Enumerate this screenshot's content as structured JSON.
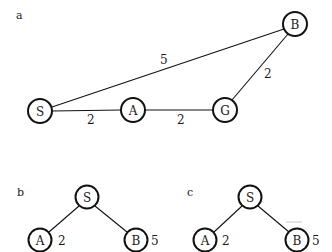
{
  "colors": {
    "stroke": "#111111",
    "text": "#1a1a1a",
    "background": "#ffffff"
  },
  "panels": {
    "a": {
      "label": "a",
      "nodes": {
        "S": {
          "label": "S",
          "x": 40,
          "y": 111
        },
        "A": {
          "label": "A",
          "x": 133,
          "y": 110
        },
        "G": {
          "label": "G",
          "x": 225,
          "y": 110
        },
        "B": {
          "label": "B",
          "x": 295,
          "y": 24
        }
      },
      "edges": [
        {
          "from": "S",
          "to": "A",
          "weight": "2"
        },
        {
          "from": "A",
          "to": "G",
          "weight": "2"
        },
        {
          "from": "S",
          "to": "B",
          "weight": "5"
        },
        {
          "from": "G",
          "to": "B",
          "weight": "2"
        }
      ]
    },
    "b": {
      "label": "b",
      "nodes": {
        "S": {
          "label": "S",
          "x": 87,
          "y": 197
        },
        "A": {
          "label": "A",
          "x": 40,
          "y": 240,
          "cost": "2"
        },
        "B": {
          "label": "B",
          "x": 136,
          "y": 240,
          "cost": "5"
        }
      }
    },
    "c": {
      "label": "c",
      "nodes": {
        "S": {
          "label": "S",
          "x": 250,
          "y": 197
        },
        "A": {
          "label": "A",
          "x": 205,
          "y": 240,
          "cost": "2"
        },
        "B": {
          "label": "B",
          "x": 297,
          "y": 240,
          "cost": "5"
        }
      }
    }
  }
}
